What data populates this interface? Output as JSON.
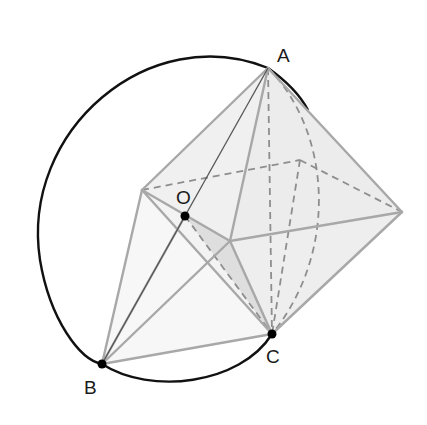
{
  "figure": {
    "type": "geometry-diagram",
    "points": {
      "A": {
        "label": "A",
        "x": 268,
        "y": 68
      },
      "B": {
        "label": "B",
        "x": 102,
        "y": 364
      },
      "C": {
        "label": "C",
        "x": 272,
        "y": 334
      },
      "O": {
        "label": "O",
        "x": 185,
        "y": 216
      }
    },
    "octahedron_vertices": {
      "top": [
        268,
        68
      ],
      "left": [
        142,
        190
      ],
      "front": [
        230,
        241
      ],
      "right": [
        402,
        212
      ],
      "bottom": [
        272,
        334
      ],
      "back": [
        300,
        160
      ]
    },
    "colors": {
      "circle": "#111111",
      "edges": "#a8a8a8",
      "hidden_edges": "#8e8e8e",
      "face_fill": "#efefef",
      "shaded_fill": "#d6d6d6",
      "point": "#000000"
    }
  }
}
